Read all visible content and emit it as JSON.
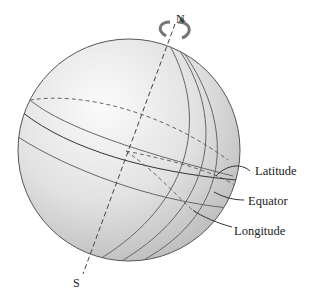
{
  "diagram": {
    "poles": {
      "north": "N",
      "south": "S"
    },
    "labels": {
      "latitude": "Latitude",
      "equator": "Equator",
      "longitude": "Longitude"
    },
    "icons": {
      "rotation": "rotation-arrow-icon"
    },
    "colors": {
      "sphere_light": "#f4f4f4",
      "sphere_dark": "#bdbdbd",
      "line": "#555555",
      "text": "#222222"
    }
  }
}
